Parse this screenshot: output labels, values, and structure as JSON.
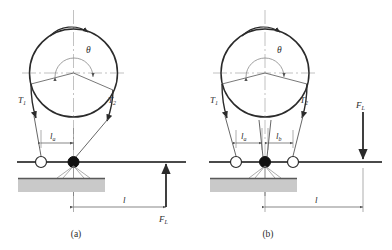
{
  "figure": {
    "background_color": "#ffffff",
    "stroke_color": "#2b2b2b",
    "axis_color": "#9a9a9a",
    "ground_fill": "#c9c9c9",
    "ground_edge": "#6f6f6f",
    "width": 392,
    "height": 250
  },
  "panels": [
    {
      "id": "panel-a",
      "caption": "(a)",
      "caption_x": 76,
      "caption_y": 236,
      "drum": {
        "center_x": 73.5,
        "center_y": 73,
        "radius": 44,
        "rotation_label": "",
        "rotation_direction": "clockwise"
      },
      "angle": {
        "symbol": "θ",
        "label_x": 86,
        "label_y": 52,
        "arc_radius": 17
      },
      "tensions": [
        {
          "name": "T1",
          "base": "T",
          "sub": "1",
          "label_x": 18,
          "label_y": 103
        },
        {
          "name": "T2",
          "base": "T",
          "sub": "2",
          "label_x": 108,
          "label_y": 103
        }
      ],
      "lever_arms": [
        {
          "name": "la",
          "base": "l",
          "sub": "a",
          "label_x": 50,
          "label_y": 139
        }
      ],
      "pivot": {
        "x": 73.5,
        "y": 162,
        "radius": 5.5
      },
      "roller": {
        "x": 41,
        "y": 162,
        "radius": 5.5
      },
      "ground": {
        "x": 18,
        "y": 178,
        "width": 87,
        "height": 14
      },
      "load": {
        "name": "FL",
        "base": "F",
        "sub": "L",
        "label_x": 160,
        "label_y": 221,
        "arrow_x": 166,
        "arrow_from_y": 207,
        "arrow_to_y": 163,
        "direction": "up"
      },
      "distance": {
        "base": "l",
        "sub": "",
        "label_x": 123,
        "label_y": 202,
        "from_x": 73.5,
        "to_x": 166,
        "y": 207
      }
    },
    {
      "id": "panel-b",
      "caption": "(b)",
      "caption_x": 268,
      "caption_y": 236,
      "drum": {
        "center_x": 265,
        "center_y": 73,
        "radius": 44,
        "rotation_label": "",
        "rotation_direction": "clockwise"
      },
      "angle": {
        "symbol": "θ",
        "label_x": 277,
        "label_y": 52,
        "arc_radius": 17
      },
      "tensions": [
        {
          "name": "T1",
          "base": "T",
          "sub": "1",
          "label_x": 210,
          "label_y": 103
        },
        {
          "name": "T2",
          "base": "T",
          "sub": "2",
          "label_x": 300,
          "label_y": 103
        }
      ],
      "lever_arms": [
        {
          "name": "la",
          "base": "l",
          "sub": "a",
          "label_x": 241,
          "label_y": 139
        },
        {
          "name": "lb",
          "base": "l",
          "sub": "b",
          "label_x": 281,
          "label_y": 139
        }
      ],
      "pivot": {
        "x": 265,
        "y": 162,
        "radius": 5.5
      },
      "roller_left": {
        "x": 236,
        "y": 162,
        "radius": 5.5
      },
      "roller_right": {
        "x": 293,
        "y": 162,
        "radius": 5.5
      },
      "ground": {
        "x": 210,
        "y": 178,
        "width": 87,
        "height": 14
      },
      "load": {
        "name": "FL",
        "base": "F",
        "sub": "L",
        "label_x": 357,
        "label_y": 107,
        "arrow_x": 363,
        "arrow_from_y": 112,
        "arrow_to_y": 161,
        "direction": "down"
      },
      "distance": {
        "base": "l",
        "sub": "",
        "label_x": 315,
        "label_y": 202,
        "from_x": 265,
        "to_x": 363,
        "y": 207
      }
    }
  ]
}
